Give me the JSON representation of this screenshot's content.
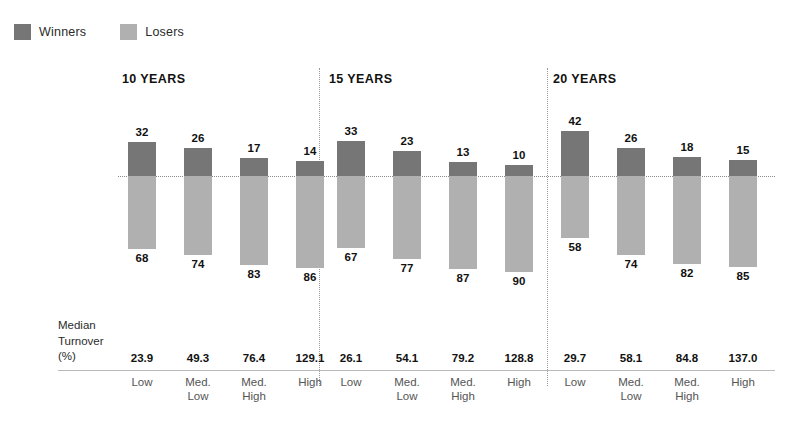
{
  "legend": {
    "entries": [
      {
        "label": "Winners",
        "color": "#767676",
        "icon": "legend-swatch-winners"
      },
      {
        "label": "Losers",
        "color": "#b0b0b0",
        "icon": "legend-swatch-losers"
      }
    ]
  },
  "axis_caption": "Median\nTurnover\n(%)",
  "chart_data": {
    "type": "bar",
    "title": "",
    "subtitle": "",
    "xlabel": "",
    "ylabel": "",
    "orientation": "vertical-diverging",
    "grid": false,
    "legend_position": "top-left",
    "baseline": 0,
    "ylim": [
      -100,
      50
    ],
    "categories": [
      "Low",
      "Med. Low",
      "Med. High",
      "High"
    ],
    "category_labels_display": [
      "Low",
      "Med.\nLow",
      "Med.\nHigh",
      "High"
    ],
    "series": [
      {
        "name": "Winners",
        "color": "#767676",
        "direction": "up"
      },
      {
        "name": "Losers",
        "color": "#b0b0b0",
        "direction": "down"
      }
    ],
    "panels": [
      {
        "title": "10 YEARS",
        "winners": [
          32,
          26,
          17,
          14
        ],
        "losers": [
          68,
          74,
          83,
          86
        ],
        "median_turnover": [
          "23.9",
          "49.3",
          "76.4",
          "129.1"
        ]
      },
      {
        "title": "15 YEARS",
        "winners": [
          33,
          23,
          13,
          10
        ],
        "losers": [
          67,
          77,
          87,
          90
        ],
        "median_turnover": [
          "26.1",
          "54.1",
          "79.2",
          "128.8"
        ]
      },
      {
        "title": "20 YEARS",
        "winners": [
          42,
          26,
          18,
          15
        ],
        "losers": [
          58,
          74,
          82,
          85
        ],
        "median_turnover": [
          "29.7",
          "58.1",
          "84.8",
          "137.0"
        ]
      }
    ],
    "median_turnover_row_label": "Median Turnover (%)"
  }
}
